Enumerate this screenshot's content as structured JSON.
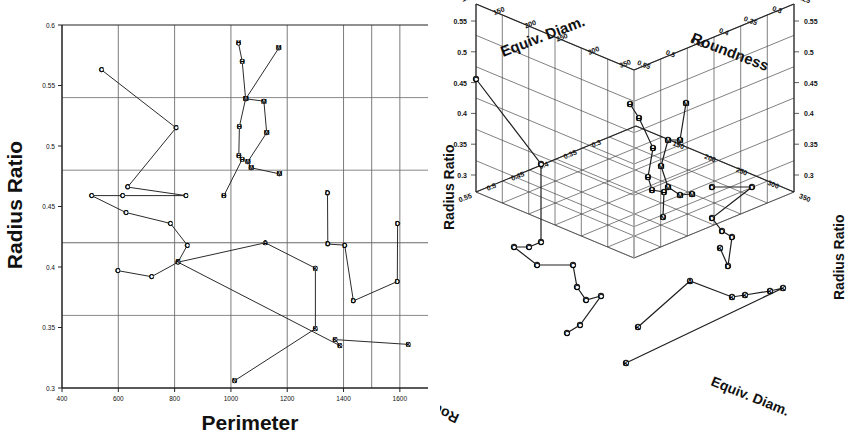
{
  "figure": {
    "panels": [
      "scatter-2d",
      "scatter-3d"
    ]
  },
  "chart_data": [
    {
      "type": "scatter",
      "id": "scatter-2d",
      "title": "",
      "xlabel": "Perimeter",
      "ylabel": "Radius Ratio",
      "xlim": [
        400,
        1700
      ],
      "ylim": [
        0.3,
        0.6
      ],
      "xticks": [
        400,
        600,
        800,
        1000,
        1200,
        1400,
        1600
      ],
      "yticks": [
        0.3,
        0.35,
        0.4,
        0.45,
        0.5,
        0.55,
        0.6
      ],
      "grid": true,
      "legend": "none",
      "series": [
        {
          "name": "C",
          "label": "C",
          "connected": true,
          "points": [
            {
              "x": 540,
              "y": 0.563,
              "label": "C"
            },
            {
              "x": 805,
              "y": 0.515,
              "label": "C"
            },
            {
              "x": 633,
              "y": 0.466,
              "label": "C"
            },
            {
              "x": 840,
              "y": 0.459,
              "label": "C"
            },
            {
              "x": 615,
              "y": 0.459,
              "label": "C"
            },
            {
              "x": 505,
              "y": 0.459,
              "label": "C"
            },
            {
              "x": 627,
              "y": 0.445,
              "label": "C"
            },
            {
              "x": 785,
              "y": 0.436,
              "label": "C"
            },
            {
              "x": 845,
              "y": 0.418,
              "label": "C"
            },
            {
              "x": 812,
              "y": 0.404,
              "label": "C"
            },
            {
              "x": 718,
              "y": 0.392,
              "label": "C"
            },
            {
              "x": 598,
              "y": 0.397,
              "label": "C"
            }
          ]
        },
        {
          "name": "H",
          "label": "H",
          "connected": true,
          "points": [
            {
              "x": 1027,
              "y": 0.585,
              "label": "H"
            },
            {
              "x": 1040,
              "y": 0.57,
              "label": "H"
            },
            {
              "x": 1052,
              "y": 0.539,
              "label": "H"
            },
            {
              "x": 1030,
              "y": 0.516,
              "label": "H"
            },
            {
              "x": 1028,
              "y": 0.492,
              "label": "H"
            },
            {
              "x": 1040,
              "y": 0.489,
              "label": "H"
            },
            {
              "x": 975,
              "y": 0.459,
              "label": "H"
            }
          ]
        },
        {
          "name": "M",
          "label": "M",
          "connected": true,
          "points": [
            {
              "x": 1170,
              "y": 0.581,
              "label": "M"
            },
            {
              "x": 1053,
              "y": 0.539,
              "label": "M"
            },
            {
              "x": 1117,
              "y": 0.537,
              "label": "M"
            },
            {
              "x": 1127,
              "y": 0.511,
              "label": "M"
            },
            {
              "x": 1060,
              "y": 0.487,
              "label": "M"
            },
            {
              "x": 1072,
              "y": 0.482,
              "label": "M"
            },
            {
              "x": 1172,
              "y": 0.477,
              "label": "M"
            }
          ]
        },
        {
          "name": "D",
          "label": "D",
          "connected": true,
          "points": [
            {
              "x": 1343,
              "y": 0.461,
              "label": "D"
            },
            {
              "x": 1344,
              "y": 0.419,
              "label": "D"
            },
            {
              "x": 1404,
              "y": 0.418,
              "label": "D"
            },
            {
              "x": 1435,
              "y": 0.372,
              "label": "D"
            },
            {
              "x": 1591,
              "y": 0.388,
              "label": "D"
            },
            {
              "x": 1592,
              "y": 0.436,
              "label": "D"
            }
          ]
        },
        {
          "name": "K",
          "label": "K",
          "connected": true,
          "points": [
            {
              "x": 1013,
              "y": 0.306,
              "label": "N"
            },
            {
              "x": 1300,
              "y": 0.349,
              "label": "K"
            },
            {
              "x": 1300,
              "y": 0.399,
              "label": "K"
            },
            {
              "x": 1122,
              "y": 0.42,
              "label": "A"
            },
            {
              "x": 812,
              "y": 0.404,
              "label": "K"
            },
            {
              "x": 1387,
              "y": 0.335,
              "label": "K"
            },
            {
              "x": 1370,
              "y": 0.34,
              "label": "K"
            },
            {
              "x": 1630,
              "y": 0.336,
              "label": "K"
            }
          ]
        }
      ]
    },
    {
      "type": "scatter",
      "id": "scatter-3d",
      "title": "",
      "projection": "3d",
      "axes": {
        "top_left": {
          "label": "Equiv. Diam.",
          "ticks": [
            100,
            150,
            200,
            250,
            300,
            350
          ]
        },
        "top_right": {
          "label": "Roundness",
          "ticks": [
            0.55,
            0.5,
            0.45,
            0.4,
            0.35,
            0.3,
            0.25
          ]
        },
        "left": {
          "label": "Radius Ratio",
          "ticks": [
            0.55,
            0.5,
            0.45,
            0.4,
            0.35,
            0.3
          ]
        },
        "right": {
          "label": "Radius Ratio",
          "ticks": [
            0.55,
            0.5,
            0.45,
            0.4,
            0.35,
            0.3
          ]
        },
        "bottom_left": {
          "label": "Roundness",
          "ticks": [
            0.55,
            0.5,
            0.45,
            0.4,
            0.35,
            0.3
          ]
        },
        "bottom_right": {
          "label": "Equiv. Diam.",
          "ticks": [
            150,
            200,
            250,
            300,
            350
          ]
        }
      },
      "grid": true,
      "legend": "none",
      "point_labels": [
        "C",
        "H",
        "M",
        "D",
        "K",
        "A",
        "N",
        "O"
      ],
      "series": [
        {
          "name": "C",
          "label": "C",
          "connected": true,
          "points": [
            {
              "px": 36,
              "py": 79,
              "label": "C"
            },
            {
              "px": 101,
              "py": 164,
              "label": "C"
            },
            {
              "px": 101,
              "py": 242,
              "label": "C"
            },
            {
              "px": 89,
              "py": 247,
              "label": "C"
            },
            {
              "px": 74,
              "py": 247,
              "label": "C"
            },
            {
              "px": 97,
              "py": 265,
              "label": "C"
            },
            {
              "px": 133,
              "py": 265,
              "label": "C"
            },
            {
              "px": 137,
              "py": 287,
              "label": "C"
            },
            {
              "px": 146,
              "py": 300,
              "label": "C"
            },
            {
              "px": 161,
              "py": 296,
              "label": "C"
            },
            {
              "px": 140,
              "py": 325,
              "label": "C"
            },
            {
              "px": 127,
              "py": 333,
              "label": "C"
            }
          ]
        },
        {
          "name": "H",
          "label": "H",
          "connected": true,
          "points": [
            {
              "px": 190,
              "py": 104,
              "label": "H"
            },
            {
              "px": 199,
              "py": 118,
              "label": "H"
            },
            {
              "px": 213,
              "py": 148,
              "label": "H"
            },
            {
              "px": 208,
              "py": 177,
              "label": "H"
            },
            {
              "px": 212,
              "py": 190,
              "label": "H"
            },
            {
              "px": 224,
              "py": 192,
              "label": "H"
            },
            {
              "px": 223,
              "py": 217,
              "label": "N"
            }
          ]
        },
        {
          "name": "M",
          "label": "M",
          "connected": true,
          "points": [
            {
              "px": 246,
              "py": 103,
              "label": "M"
            },
            {
              "px": 240,
              "py": 140,
              "label": "M"
            },
            {
              "px": 228,
              "py": 140,
              "label": "M"
            },
            {
              "px": 221,
              "py": 166,
              "label": "M"
            },
            {
              "px": 228,
              "py": 187,
              "label": "M"
            },
            {
              "px": 240,
              "py": 195,
              "label": "M"
            },
            {
              "px": 252,
              "py": 194,
              "label": "M"
            }
          ]
        },
        {
          "name": "D",
          "label": "D",
          "connected": true,
          "points": [
            {
              "px": 272,
              "py": 187,
              "label": "D"
            },
            {
              "px": 312,
              "py": 187,
              "label": "D"
            },
            {
              "px": 272,
              "py": 218,
              "label": "D"
            },
            {
              "px": 282,
              "py": 231,
              "label": "D"
            },
            {
              "px": 292,
              "py": 237,
              "label": "D"
            },
            {
              "px": 288,
              "py": 266,
              "label": "D"
            },
            {
              "px": 280,
              "py": 248,
              "label": "K"
            }
          ]
        },
        {
          "name": "K",
          "label": "K",
          "connected": true,
          "points": [
            {
              "px": 198,
              "py": 327,
              "label": "K"
            },
            {
              "px": 250,
              "py": 281,
              "label": "A"
            },
            {
              "px": 292,
              "py": 297,
              "label": "K"
            },
            {
              "px": 305,
              "py": 295,
              "label": "K"
            },
            {
              "px": 330,
              "py": 291,
              "label": "K"
            },
            {
              "px": 343,
              "py": 288,
              "label": "K"
            },
            {
              "px": 186,
              "py": 363,
              "label": "K"
            }
          ]
        }
      ]
    }
  ],
  "labels2d": {
    "xlabel": "Perimeter",
    "ylabel": "Radius Ratio",
    "xticks": [
      "400",
      "600",
      "800",
      "1000",
      "1200",
      "1400",
      "1600"
    ],
    "yticks": [
      "0.3",
      "0.35",
      "0.4",
      "0.45",
      "0.5",
      "0.55",
      "0.6"
    ]
  },
  "labels3d": {
    "equiv_diam": "Equiv. Diam.",
    "roundness": "Roundness",
    "radius_ratio": "Radius Ratio",
    "top_left_ticks": [
      "100",
      "150",
      "200",
      "250",
      "300",
      "350"
    ],
    "top_right_ticks": [
      "0.55",
      "0.5",
      "0.45",
      "0.4",
      "0.35",
      "0.3",
      "0.25"
    ],
    "left_ticks": [
      "0.55",
      "0.5",
      "0.45",
      "0.4",
      "0.35",
      "0.3"
    ],
    "right_ticks": [
      "0.55",
      "0.5",
      "0.45",
      "0.4",
      "0.35",
      "0.3"
    ],
    "bottom_left_ticks": [
      "0.55",
      "0.5",
      "0.45",
      "0.4",
      "0.35",
      "0.3"
    ],
    "bottom_right_ticks": [
      "150",
      "200",
      "250",
      "300",
      "350"
    ]
  },
  "colors": {
    "line": "#2b2b2b",
    "grid": "#555555",
    "text": "#111111",
    "background": "#ffffff"
  }
}
